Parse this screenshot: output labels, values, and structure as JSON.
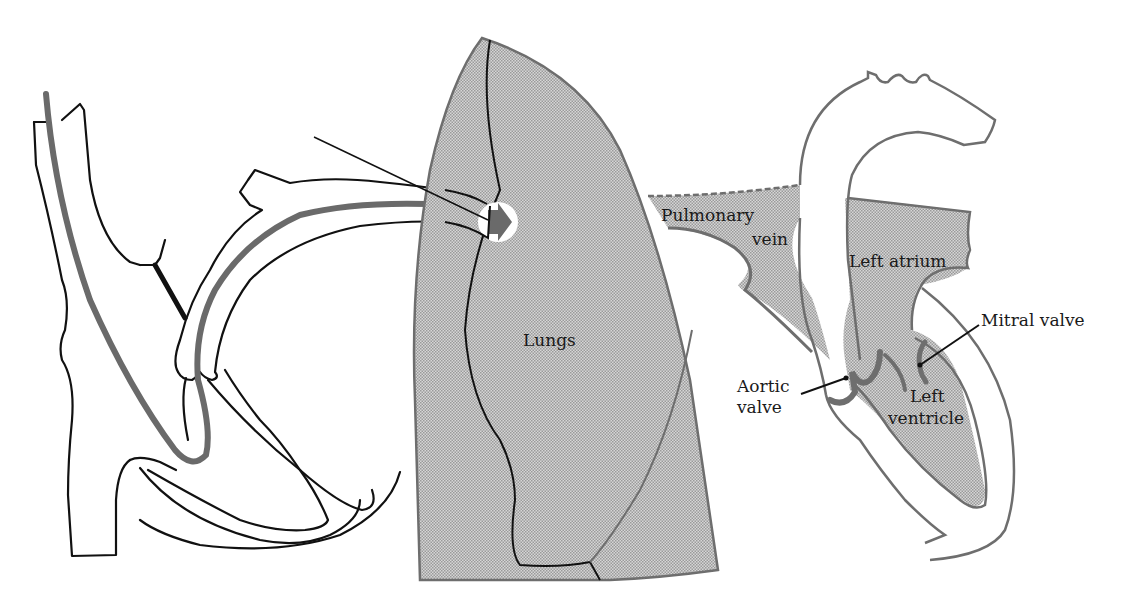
{
  "diagram": {
    "colors": {
      "background": "#ffffff",
      "outline": "#111111",
      "gray_stroke": "#6e6e6e",
      "stipple_fill": "#c9c9c9",
      "catheter": "#6a6a6a"
    },
    "labels": {
      "lungs": "Lungs",
      "pulmonary_vein_line1": "Pulmonary",
      "pulmonary_vein_line2": "vein",
      "left_atrium": "Left atrium",
      "mitral_valve": "Mitral valve",
      "aortic_valve_line1": "Aortic",
      "aortic_valve_line2": "valve",
      "left_ventricle_line1": "Left",
      "left_ventricle_line2": "ventricle"
    },
    "regions": [
      "right-heart-vena-cava",
      "pulmonary-artery-with-catheter",
      "lungs",
      "pulmonary-vein",
      "left-heart-aorta"
    ]
  }
}
